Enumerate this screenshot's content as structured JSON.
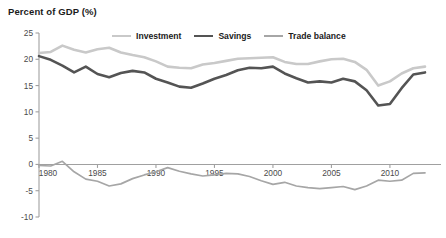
{
  "chart_data": {
    "type": "line",
    "title": "Percent of GDP (%)",
    "xlabel": "",
    "ylabel": "Percent of GDP (%)",
    "xlim": [
      1980,
      2013
    ],
    "ylim": [
      -10,
      25
    ],
    "grid": false,
    "legend_position": "top-center",
    "y_ticks": [
      "25",
      "20",
      "15",
      "10",
      "5",
      "0",
      "-5",
      "-10"
    ],
    "y_tick_values": [
      25,
      20,
      15,
      10,
      5,
      0,
      -5,
      -10
    ],
    "x_ticks": [
      "1980",
      "1985",
      "1990",
      "1995",
      "2000",
      "2005",
      "2010"
    ],
    "x_tick_values": [
      1980,
      1985,
      1990,
      1995,
      2000,
      2005,
      2010
    ],
    "x": [
      1980,
      1981,
      1982,
      1983,
      1984,
      1985,
      1986,
      1987,
      1988,
      1989,
      1990,
      1991,
      1992,
      1993,
      1994,
      1995,
      1996,
      1997,
      1998,
      1999,
      2000,
      2001,
      2002,
      2003,
      2004,
      2005,
      2006,
      2007,
      2008,
      2009,
      2010,
      2011,
      2012,
      2013
    ],
    "series": [
      {
        "name": "Investment",
        "color": "#c9c9c9",
        "width": 2.6,
        "values": [
          21.2,
          21.4,
          22.6,
          21.8,
          21.3,
          21.9,
          22.2,
          21.3,
          20.8,
          20.4,
          19.6,
          18.6,
          18.4,
          18.3,
          19.0,
          19.3,
          19.7,
          20.1,
          20.2,
          20.3,
          20.4,
          19.5,
          19.1,
          19.1,
          19.6,
          20.0,
          20.1,
          19.5,
          18.0,
          15.0,
          15.8,
          17.3,
          18.3,
          18.6
        ]
      },
      {
        "name": "Savings",
        "color": "#545454",
        "width": 2.6,
        "values": [
          20.6,
          19.9,
          18.8,
          17.5,
          18.6,
          17.2,
          16.6,
          17.4,
          17.8,
          17.5,
          16.3,
          15.6,
          14.8,
          14.6,
          15.4,
          16.3,
          17.0,
          17.9,
          18.4,
          18.3,
          18.6,
          17.3,
          16.4,
          15.6,
          15.8,
          15.6,
          16.3,
          15.8,
          14.1,
          11.2,
          11.5,
          14.5,
          17.1,
          17.5
        ]
      },
      {
        "name": "Trade balance",
        "color": "#a6a6a6",
        "width": 1.7,
        "values": [
          -0.2,
          -0.3,
          0.6,
          -1.4,
          -2.8,
          -3.2,
          -4.1,
          -3.7,
          -2.7,
          -2.0,
          -1.4,
          -0.6,
          -1.3,
          -1.8,
          -2.2,
          -2.0,
          -1.7,
          -1.8,
          -2.3,
          -3.1,
          -3.8,
          -3.4,
          -4.1,
          -4.4,
          -4.6,
          -4.4,
          -4.2,
          -4.8,
          -4.1,
          -3.0,
          -3.2,
          -3.0,
          -1.7,
          -1.6
        ]
      }
    ]
  },
  "axis": {
    "line_color": "#a0a0a0"
  }
}
